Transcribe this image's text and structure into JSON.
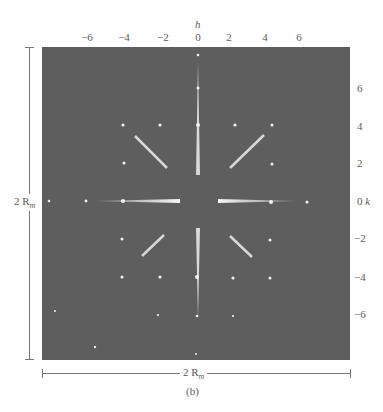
{
  "figure": {
    "caption": "(b)",
    "h_axis": {
      "label": "h",
      "ticks": [
        "−6",
        "−4",
        "−2",
        "0",
        "2",
        "4",
        "6"
      ]
    },
    "k_axis": {
      "label": "k",
      "ticks": [
        "6",
        "4",
        "2",
        "0",
        "−2",
        "−4",
        "−6"
      ]
    },
    "vertical_dimension": {
      "label": "2 R",
      "subscript": "m"
    },
    "horizontal_dimension": {
      "label": "2 R",
      "subscript": "m"
    },
    "pattern_background": "#5e5e5e",
    "spot_color": "#f2f2f2"
  }
}
